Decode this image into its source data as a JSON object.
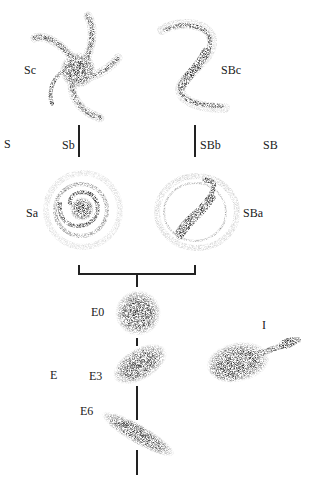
{
  "diagram": {
    "colors": {
      "ink": "#111111",
      "background": "#ffffff"
    },
    "branch_labels": {
      "spiral": "S",
      "barred_spiral": "SB",
      "elliptical": "E",
      "irregular": "I"
    },
    "spirals": [
      {
        "id": "Sc",
        "label": "Sc"
      },
      {
        "id": "Sb",
        "label": "Sb"
      },
      {
        "id": "Sa",
        "label": "Sa"
      }
    ],
    "barred_spirals": [
      {
        "id": "SBc",
        "label": "SBc"
      },
      {
        "id": "SBb",
        "label": "SBb"
      },
      {
        "id": "SBa",
        "label": "SBa"
      }
    ],
    "ellipticals": [
      {
        "id": "E0",
        "label": "E0"
      },
      {
        "id": "E3",
        "label": "E3"
      },
      {
        "id": "E6",
        "label": "E6"
      }
    ]
  }
}
